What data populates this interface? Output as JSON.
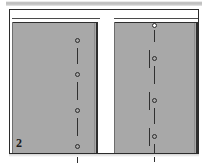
{
  "figure": {
    "number_label": "2",
    "caption": "",
    "background_color": "#ffffff",
    "frame_color": "#2b2b2b",
    "panel_fill_color": "#a8a8a8",
    "line_color": "#303030"
  },
  "top_bar": {
    "name": "scan-banner",
    "color_start": "#b9b9b9",
    "color_end": "#e8e8e8"
  },
  "panels": [
    {
      "id": "left-panel",
      "label": "",
      "x": 2,
      "y": 12,
      "width": 86,
      "height": 131,
      "fill": "#a8a8a8",
      "reveal": {
        "x": 2,
        "y": 8,
        "width": 88,
        "height": 4
      }
    },
    {
      "id": "right-panel",
      "label": "",
      "x": 104,
      "y": 12,
      "width": 84,
      "height": 131,
      "fill": "#a8a8a8",
      "reveal": {
        "x": 104,
        "y": 8,
        "width": 84,
        "height": 4
      }
    }
  ],
  "pin_columns": [
    {
      "id": "left-panel-centerline",
      "panel": "left-panel",
      "x": 65,
      "top": 13,
      "bottom": 143,
      "pins": [
        {
          "cy": 18,
          "on_white": false
        },
        {
          "cy": 52,
          "on_white": false
        },
        {
          "cy": 88,
          "on_white": false
        },
        {
          "cy": 124,
          "on_white": false
        }
      ],
      "dashes": [
        {
          "y": 26,
          "length": 16
        },
        {
          "y": 60,
          "length": 18
        },
        {
          "y": 96,
          "length": 18
        },
        {
          "y": 132,
          "length": 10
        }
      ],
      "ticks": []
    },
    {
      "id": "right-panel-centerline",
      "panel": "right-panel",
      "x": 40,
      "top": 2,
      "bottom": 143,
      "pins": [
        {
          "cy": 3,
          "on_white": true
        },
        {
          "cy": 36,
          "on_white": false
        },
        {
          "cy": 78,
          "on_white": false
        },
        {
          "cy": 114,
          "on_white": false
        }
      ],
      "dashes": [
        {
          "y": 8,
          "length": 12
        },
        {
          "y": 44,
          "length": 18
        },
        {
          "y": 86,
          "length": 16
        },
        {
          "y": 122,
          "length": 18
        }
      ],
      "ticks": [
        {
          "x": -5,
          "y": 28,
          "length": 18
        },
        {
          "x": -5,
          "y": 70,
          "length": 18
        },
        {
          "x": -5,
          "y": 106,
          "length": 18
        }
      ]
    }
  ]
}
